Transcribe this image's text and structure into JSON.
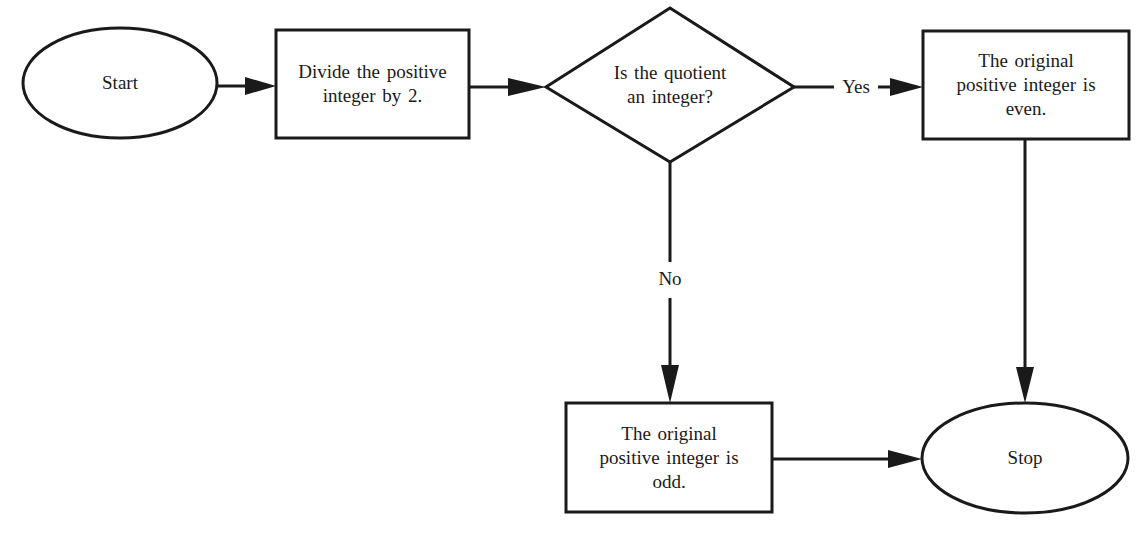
{
  "diagram": {
    "type": "flowchart",
    "title": "",
    "colors": {
      "stroke": "#1a1a1a",
      "fill": "#ffffff",
      "text": "#1a1a1a"
    },
    "nodes": {
      "start": {
        "shape": "ellipse",
        "label": "Start"
      },
      "divide": {
        "shape": "rectangle",
        "lines": [
          "Divide the positive",
          "integer by 2."
        ]
      },
      "decision": {
        "shape": "diamond",
        "lines": [
          "Is the quotient",
          "an integer?"
        ]
      },
      "even": {
        "shape": "rectangle",
        "lines": [
          "The original",
          "positive integer is",
          "even."
        ]
      },
      "odd": {
        "shape": "rectangle",
        "lines": [
          "The original",
          "positive integer is",
          "odd."
        ]
      },
      "stop": {
        "shape": "ellipse",
        "label": "Stop"
      }
    },
    "edges": {
      "start_to_divide": {
        "from": "start",
        "to": "divide",
        "label": ""
      },
      "divide_to_decision": {
        "from": "divide",
        "to": "decision",
        "label": ""
      },
      "decision_yes": {
        "from": "decision",
        "to": "even",
        "label": "Yes"
      },
      "decision_no": {
        "from": "decision",
        "to": "odd",
        "label": "No"
      },
      "even_to_stop": {
        "from": "even",
        "to": "stop",
        "label": ""
      },
      "odd_to_stop": {
        "from": "odd",
        "to": "stop",
        "label": ""
      }
    }
  }
}
